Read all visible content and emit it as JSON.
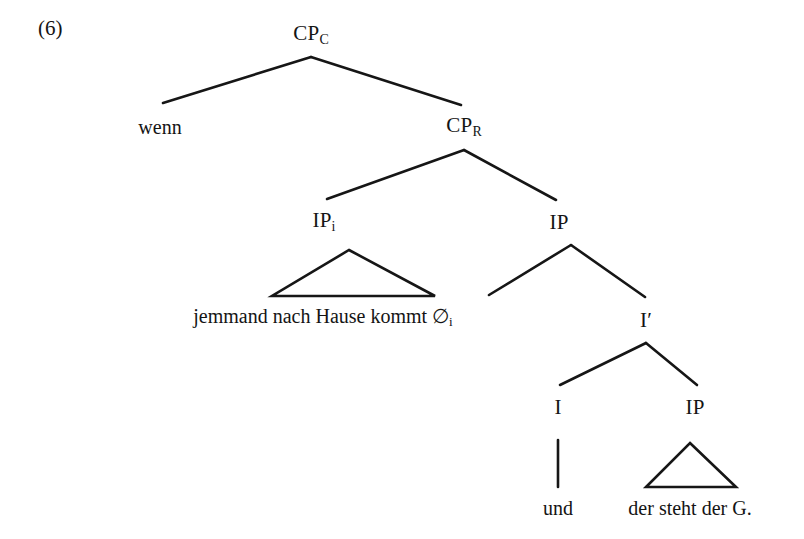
{
  "example": {
    "number": "(6)"
  },
  "tree": {
    "nodes": [
      {
        "id": "cp-c",
        "label": "CP",
        "subscript": "C",
        "x": 311,
        "y": 35
      },
      {
        "id": "cp-r",
        "label": "CP",
        "subscript": "R",
        "x": 464,
        "y": 127
      },
      {
        "id": "ip-i",
        "label": "IP",
        "subscript": "i",
        "x": 324,
        "y": 222
      },
      {
        "id": "ip-right",
        "label": "IP",
        "subscript": "",
        "x": 559,
        "y": 222
      },
      {
        "id": "i-bar",
        "label": "I′",
        "subscript": "",
        "x": 646,
        "y": 320
      },
      {
        "id": "i-head",
        "label": "I",
        "subscript": "",
        "x": 558,
        "y": 407
      },
      {
        "id": "ip-low",
        "label": "IP",
        "subscript": "",
        "x": 695,
        "y": 407
      }
    ],
    "terminals": [
      {
        "id": "wenn",
        "text": "wenn",
        "subscript": "",
        "x": 160,
        "y": 127
      },
      {
        "id": "jemmand",
        "text": "jemmand nach Hause kommt ∅",
        "subscript": "i",
        "x": 323,
        "y": 317
      },
      {
        "id": "und",
        "text": "und",
        "subscript": "",
        "x": 558,
        "y": 508
      },
      {
        "id": "der-steht",
        "text": "der steht der G.",
        "subscript": "",
        "x": 690,
        "y": 508
      }
    ],
    "branches": [
      {
        "id": "cpc-to-wenn",
        "x1": 311,
        "y1": 57,
        "x2": 163,
        "y2": 103
      },
      {
        "id": "cpc-to-cpr",
        "x1": 311,
        "y1": 57,
        "x2": 461,
        "y2": 105
      },
      {
        "id": "cpr-to-ipi",
        "x1": 464,
        "y1": 150,
        "x2": 327,
        "y2": 199
      },
      {
        "id": "cpr-to-ip",
        "x1": 464,
        "y1": 150,
        "x2": 556,
        "y2": 200
      },
      {
        "id": "ip-to-left",
        "x1": 571,
        "y1": 245,
        "x2": 489,
        "y2": 295
      },
      {
        "id": "ip-to-ibar",
        "x1": 571,
        "y1": 245,
        "x2": 645,
        "y2": 297
      },
      {
        "id": "ibar-to-i",
        "x1": 646,
        "y1": 343,
        "x2": 560,
        "y2": 385
      },
      {
        "id": "ibar-to-iplow",
        "x1": 646,
        "y1": 343,
        "x2": 697,
        "y2": 385
      },
      {
        "id": "i-to-und",
        "x1": 558,
        "y1": 440,
        "x2": 558,
        "y2": 487
      }
    ],
    "triangles": [
      {
        "id": "triangle-ipi",
        "apex_x": 349,
        "apex_y": 250,
        "left_x": 272,
        "right_x": 435,
        "base_y": 296
      },
      {
        "id": "triangle-iplow",
        "apex_x": 690,
        "apex_y": 443,
        "left_x": 646,
        "right_x": 736,
        "base_y": 487
      }
    ]
  },
  "colors": {
    "ink": "#141414",
    "line": "#161616",
    "background": "#ffffff"
  }
}
